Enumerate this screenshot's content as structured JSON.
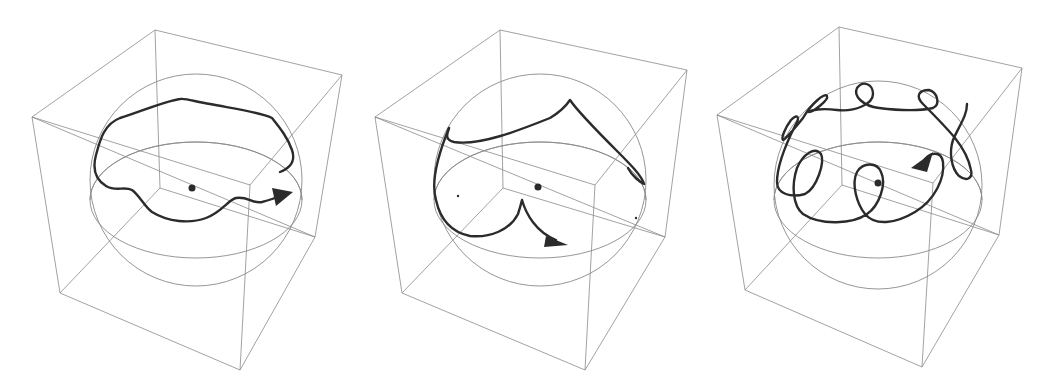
{
  "figure": {
    "colors": {
      "background": "#ffffff",
      "wireframe": "#8a8a8a",
      "trajectory": "#2b2b2b"
    },
    "panels": [
      {
        "id": "left",
        "trajectory_type": "wavy-precession",
        "has_arrow": true,
        "center_dot": true
      },
      {
        "id": "middle",
        "trajectory_type": "cusped-precession",
        "has_arrow": true,
        "center_dot": true
      },
      {
        "id": "right",
        "trajectory_type": "looped-precession",
        "has_arrow": true,
        "center_dot": true
      }
    ]
  }
}
